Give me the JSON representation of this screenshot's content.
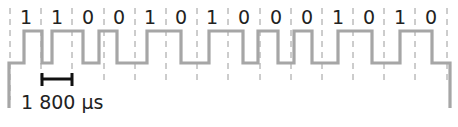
{
  "diagram": {
    "bits": [
      "1",
      "1",
      "0",
      "0",
      "1",
      "0",
      "1",
      "0",
      "0",
      "0",
      "1",
      "0",
      "1",
      "0"
    ],
    "scale_bar": {
      "label": "1 800 µs"
    },
    "colors": {
      "waveform": "#a6a6a6",
      "gridlines": "#9a9a9a",
      "scale_bar": "#111111",
      "text": "#222222",
      "background": "#ffffff"
    },
    "waveform_transitions_x": [
      9,
      24,
      42,
      52,
      83,
      99,
      117,
      147,
      181,
      209,
      243,
      258,
      278,
      294,
      312,
      338,
      372,
      400,
      432,
      450
    ],
    "levels": {
      "high_y": 31,
      "low_y": 63
    }
  }
}
